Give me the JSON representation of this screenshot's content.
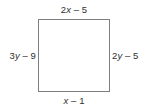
{
  "figure": {
    "type": "geometry-diagram",
    "shape": "square",
    "shape_name": "quadrilateral",
    "background_color": "#ffffff",
    "border_color": "#7e7e7e",
    "text_color": "#2f2f2f",
    "labels": {
      "top": "2x – 5",
      "right": "2y – 5",
      "bottom": "x – 1",
      "left": "3y – 9"
    },
    "expressions": {
      "top": {
        "coefficient": 2,
        "variable": "x",
        "operator": "–",
        "constant": 5
      },
      "right": {
        "coefficient": 2,
        "variable": "y",
        "operator": "–",
        "constant": 5
      },
      "bottom": {
        "coefficient": 1,
        "variable": "x",
        "operator": "–",
        "constant": 1
      },
      "left": {
        "coefficient": 3,
        "variable": "y",
        "operator": "–",
        "constant": 9
      }
    }
  }
}
